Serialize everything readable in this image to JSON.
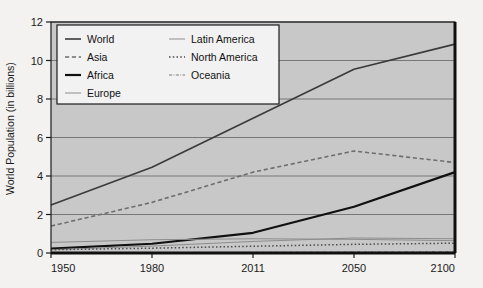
{
  "chart_data": {
    "type": "line",
    "title": "",
    "xlabel": "",
    "ylabel": "World Population (in billions)",
    "xlim": [
      1950,
      2100
    ],
    "ylim": [
      0,
      12
    ],
    "grid": true,
    "legend_position": "top-left-inside",
    "x_ticks": [
      "1950",
      "1980",
      "2011",
      "2050",
      "2100"
    ],
    "x_tick_values": [
      1950,
      1980,
      2011,
      2050,
      2100
    ],
    "y_ticks": [
      "0",
      "2",
      "4",
      "6",
      "8",
      "10",
      "12"
    ],
    "y_tick_values": [
      0,
      2,
      4,
      6,
      8,
      10,
      12
    ],
    "x": [
      1950,
      1980,
      2011,
      2050,
      2100
    ],
    "series": [
      {
        "name": "World",
        "style": "solid",
        "color": "#3a3a3a",
        "width": 1.6,
        "values": [
          2.5,
          4.45,
          7.0,
          9.55,
          10.85
        ]
      },
      {
        "name": "Asia",
        "style": "dashed",
        "color": "#6e6e6e",
        "width": 1.6,
        "values": [
          1.4,
          2.63,
          4.2,
          5.3,
          4.7
        ]
      },
      {
        "name": "Africa",
        "style": "solid",
        "color": "#101010",
        "width": 2.2,
        "values": [
          0.23,
          0.48,
          1.05,
          2.4,
          4.2
        ]
      },
      {
        "name": "Europe",
        "style": "solid",
        "color": "#8d8d8d",
        "width": 1.0,
        "values": [
          0.55,
          0.69,
          0.74,
          0.71,
          0.64
        ]
      },
      {
        "name": "Latin America",
        "style": "solid",
        "color": "#8d8d8d",
        "width": 1.0,
        "values": [
          0.17,
          0.36,
          0.6,
          0.78,
          0.74
        ]
      },
      {
        "name": "North America",
        "style": "dotted",
        "color": "#4a4a4a",
        "width": 1.5,
        "values": [
          0.17,
          0.25,
          0.35,
          0.45,
          0.51
        ]
      },
      {
        "name": "Oceania",
        "style": "dashdot",
        "color": "#7a7a7a",
        "width": 1.0,
        "values": [
          0.013,
          0.023,
          0.037,
          0.057,
          0.07
        ]
      }
    ],
    "legend_columns": [
      [
        "World",
        "Asia",
        "Africa",
        "Europe"
      ],
      [
        "Latin America",
        "North America",
        "Oceania"
      ]
    ],
    "colors": {
      "plot_background": "#c8c8c8",
      "figure_background": "#f3f2f0",
      "gridline": "#6d6d6d",
      "axis": "#1b1b1b",
      "legend_background": "#f2f2f2",
      "legend_border": "#1b1b1b"
    }
  }
}
